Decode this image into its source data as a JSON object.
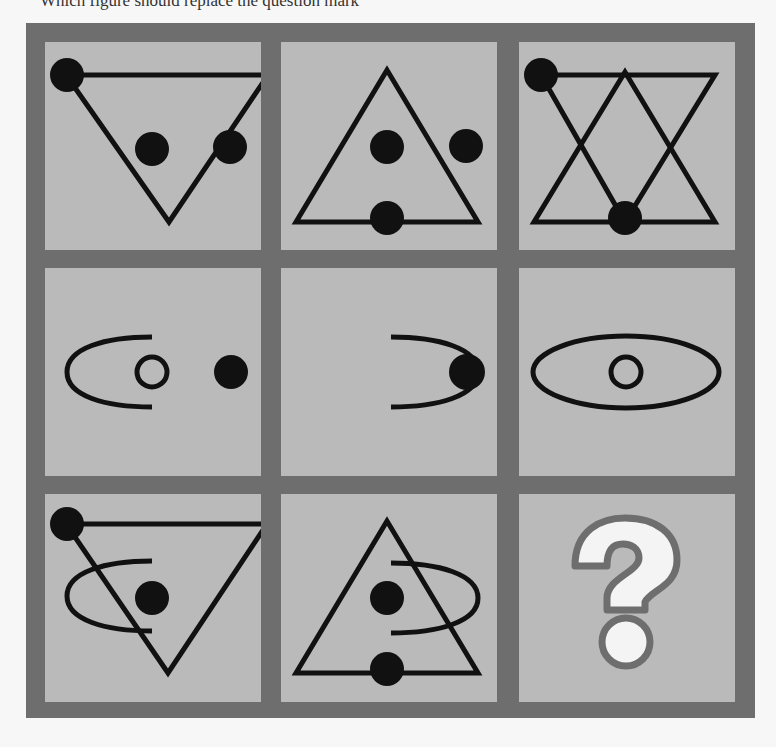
{
  "caption": "Which figure should replace the question mark",
  "colors": {
    "frame": "#6e6e6e",
    "cell_fill": "#bababa",
    "stroke": "#111111",
    "question_fill": "#f4f4f4",
    "question_outline": "#6e6e6e"
  },
  "grid": {
    "rows": 3,
    "cols": 3,
    "cells": [
      {
        "row": 1,
        "col": 1,
        "content": "inverted triangle, dot on top-left vertex, dot inside, dot outside right"
      },
      {
        "row": 1,
        "col": 2,
        "content": "upright triangle, dot inside, dot outside right, dot on bottom edge"
      },
      {
        "row": 1,
        "col": 3,
        "content": "overlapping inverted and upright triangles, dot on top-left vertex, dot on bottom edge"
      },
      {
        "row": 2,
        "col": 1,
        "content": "left half-ellipse arc, small hollow circle, filled dot on right"
      },
      {
        "row": 2,
        "col": 2,
        "content": "right half-ellipse arc with filled dot at tip"
      },
      {
        "row": 2,
        "col": 3,
        "content": "full ellipse with small hollow circle in center"
      },
      {
        "row": 3,
        "col": 1,
        "content": "inverted triangle with vertex dot, left arc, inner dot"
      },
      {
        "row": 3,
        "col": 2,
        "content": "upright triangle with inner dot, bottom-edge dot, right arc"
      },
      {
        "row": 3,
        "col": 3,
        "content": "question mark",
        "symbol": "?"
      }
    ]
  }
}
